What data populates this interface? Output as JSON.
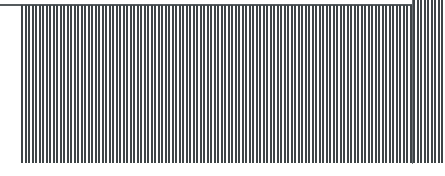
{
  "canvas": {
    "width": 445,
    "height": 176,
    "background_color": "#ffffff"
  },
  "colors": {
    "bar": "#3e4447",
    "axis_line": "#555b5e",
    "divider": "#6a7074",
    "background": "#ffffff"
  },
  "axis": {
    "top_rule_label": "",
    "top_rule_x_start": 0,
    "top_rule_x_end": 413,
    "top_rule_y": 4
  },
  "chart_data": {
    "type": "bar",
    "title": "",
    "subtitle": "",
    "xlabel": "",
    "ylabel": "",
    "grid": false,
    "legend": null,
    "orientation": "vertical",
    "bar_width_px": 2,
    "bar_gap_px": 1.5,
    "baseline": "bottom",
    "xlim": [
      0,
      121
    ],
    "ylim": [
      0,
      1
    ],
    "categories": [
      "1",
      "2",
      "3",
      "4",
      "5",
      "6",
      "7",
      "8",
      "9",
      "10",
      "11",
      "12",
      "13",
      "14",
      "15",
      "16",
      "17",
      "18",
      "19",
      "20",
      "21",
      "22",
      "23",
      "24",
      "25",
      "26",
      "27",
      "28",
      "29",
      "30",
      "31",
      "32",
      "33",
      "34",
      "35",
      "36",
      "37",
      "38",
      "39",
      "40",
      "41",
      "42",
      "43",
      "44",
      "45",
      "46",
      "47",
      "48",
      "49",
      "50",
      "51",
      "52",
      "53",
      "54",
      "55",
      "56",
      "57",
      "58",
      "59",
      "60",
      "61",
      "62",
      "63",
      "64",
      "65",
      "66",
      "67",
      "68",
      "69",
      "70",
      "71",
      "72",
      "73",
      "74",
      "75",
      "76",
      "77",
      "78",
      "79",
      "80",
      "81",
      "82",
      "83",
      "84",
      "85",
      "86",
      "87",
      "88",
      "89",
      "90",
      "91",
      "92",
      "93",
      "94",
      "95",
      "96",
      "97",
      "98",
      "99",
      "100",
      "101",
      "102",
      "103",
      "104",
      "105",
      "106",
      "107",
      "108",
      "109",
      "110",
      "111",
      "112",
      "113",
      "114",
      "115",
      "116",
      "117",
      "118",
      "119",
      "120",
      "121"
    ],
    "values": [
      1,
      1,
      1,
      1,
      1,
      1,
      1,
      1,
      1,
      1,
      1,
      1,
      1,
      1,
      1,
      1,
      1,
      1,
      1,
      1,
      1,
      1,
      1,
      1,
      1,
      1,
      1,
      1,
      1,
      1,
      1,
      1,
      1,
      1,
      1,
      1,
      1,
      1,
      1,
      1,
      1,
      1,
      1,
      1,
      1,
      1,
      1,
      1,
      1,
      1,
      1,
      1,
      1,
      1,
      1,
      1,
      1,
      1,
      1,
      1,
      1,
      1,
      1,
      1,
      1,
      1,
      1,
      1,
      1,
      1,
      1,
      1,
      1,
      1,
      1,
      1,
      1,
      1,
      1,
      1,
      1,
      1,
      1,
      1,
      1,
      1,
      1,
      1,
      1,
      1,
      1,
      1,
      1,
      1,
      1,
      1,
      1,
      1,
      1,
      1,
      1,
      1,
      1,
      1,
      1,
      1,
      1,
      1,
      1,
      1,
      1,
      1,
      1,
      1,
      1,
      1,
      1,
      1,
      1,
      1,
      1
    ],
    "regions": [
      {
        "name": "main",
        "bar_count": 112,
        "x_start_px": 21,
        "x_end_px": 413,
        "top_px": 5,
        "bottom_px": 163
      },
      {
        "name": "right-extended",
        "bar_count": 9,
        "x_start_px": 413,
        "x_end_px": 445,
        "top_px": 0,
        "bottom_px": 163
      }
    ]
  },
  "annotations": {
    "tick_labels": [],
    "data_labels": [],
    "notes": []
  }
}
